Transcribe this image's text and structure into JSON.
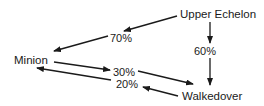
{
  "diagram": {
    "nodes": [
      {
        "id": "upper",
        "label": "Upper Echelon"
      },
      {
        "id": "minion",
        "label": "Minion"
      },
      {
        "id": "walkedover",
        "label": "Walkedover"
      }
    ],
    "edges": [
      {
        "from": "Upper Echelon",
        "to": "Minion",
        "label": "70%"
      },
      {
        "from": "Upper Echelon",
        "to": "Walkedover",
        "label": "60%"
      },
      {
        "from": "Minion",
        "to": "Walkedover",
        "label": "30%"
      },
      {
        "from": "Walkedover",
        "to": "Minion",
        "label": "20%"
      }
    ],
    "colors": {
      "stroke": "#1a1a1a",
      "background": "#ffffff"
    }
  }
}
